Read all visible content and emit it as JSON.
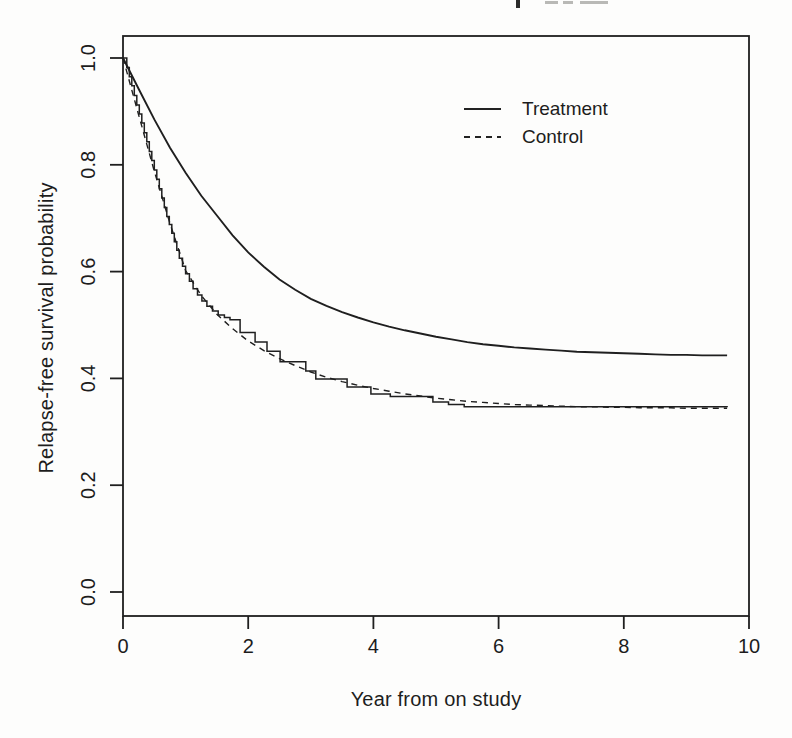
{
  "figure": {
    "background": "#fdfdfc",
    "ink": "#1f1f1f",
    "cropped_title": {
      "visible": true,
      "legible": false
    }
  },
  "chart_data": {
    "type": "line",
    "title": "",
    "xlabel": "Year from on study",
    "ylabel": "Relapse-free survival probability",
    "xlim": [
      0,
      10
    ],
    "ylim": [
      0.0,
      1.0
    ],
    "grid": false,
    "x_ticks": {
      "values": [
        0,
        2,
        4,
        6,
        8,
        10
      ],
      "labels": [
        "0",
        "2",
        "4",
        "6",
        "8",
        "10"
      ]
    },
    "y_ticks": {
      "values": [
        0.0,
        0.2,
        0.4,
        0.6,
        0.8,
        1.0
      ],
      "labels": [
        "0.0",
        "0.2",
        "0.4",
        "0.6",
        "0.8",
        "1.0"
      ]
    },
    "legend": {
      "position": "top-right-inside",
      "entries": [
        {
          "label": "Treatment",
          "line_style": "solid"
        },
        {
          "label": "Control",
          "line_style": "dashed"
        }
      ]
    },
    "series": [
      {
        "name": "Treatment",
        "line_style": "solid",
        "curve_type": "smooth",
        "asymptote": 0.44,
        "points": [
          [
            0,
            1.0
          ],
          [
            0.25,
            0.942
          ],
          [
            0.5,
            0.885
          ],
          [
            0.75,
            0.832
          ],
          [
            1,
            0.785
          ],
          [
            1.25,
            0.742
          ],
          [
            1.5,
            0.705
          ],
          [
            1.75,
            0.668
          ],
          [
            2,
            0.636
          ],
          [
            2.25,
            0.609
          ],
          [
            2.5,
            0.585
          ],
          [
            2.75,
            0.566
          ],
          [
            3,
            0.549
          ],
          [
            3.25,
            0.536
          ],
          [
            3.5,
            0.524
          ],
          [
            3.75,
            0.514
          ],
          [
            4,
            0.505
          ],
          [
            4.25,
            0.497
          ],
          [
            4.5,
            0.49
          ],
          [
            4.75,
            0.484
          ],
          [
            5,
            0.478
          ],
          [
            5.25,
            0.473
          ],
          [
            5.5,
            0.468
          ],
          [
            5.75,
            0.464
          ],
          [
            6,
            0.461
          ],
          [
            6.25,
            0.458
          ],
          [
            6.5,
            0.456
          ],
          [
            6.75,
            0.454
          ],
          [
            7,
            0.452
          ],
          [
            7.25,
            0.45
          ],
          [
            7.5,
            0.449
          ],
          [
            7.75,
            0.448
          ],
          [
            8,
            0.447
          ],
          [
            8.25,
            0.446
          ],
          [
            8.5,
            0.445
          ],
          [
            8.75,
            0.444
          ],
          [
            9,
            0.444
          ],
          [
            9.25,
            0.443
          ],
          [
            9.5,
            0.443
          ],
          [
            9.65,
            0.443
          ]
        ]
      },
      {
        "name": "Control",
        "line_style": "dashed",
        "curve_type": "smooth",
        "asymptote": 0.34,
        "points": [
          [
            0,
            1.0
          ],
          [
            0.25,
            0.893
          ],
          [
            0.5,
            0.788
          ],
          [
            0.75,
            0.69
          ],
          [
            1,
            0.602
          ],
          [
            1.25,
            0.555
          ],
          [
            1.5,
            0.52
          ],
          [
            1.75,
            0.493
          ],
          [
            2,
            0.47
          ],
          [
            2.25,
            0.452
          ],
          [
            2.5,
            0.437
          ],
          [
            2.75,
            0.424
          ],
          [
            3,
            0.412
          ],
          [
            3.25,
            0.402
          ],
          [
            3.5,
            0.394
          ],
          [
            3.75,
            0.387
          ],
          [
            4,
            0.381
          ],
          [
            4.25,
            0.376
          ],
          [
            4.5,
            0.371
          ],
          [
            4.75,
            0.367
          ],
          [
            5,
            0.363
          ],
          [
            5.25,
            0.36
          ],
          [
            5.5,
            0.357
          ],
          [
            5.75,
            0.355
          ],
          [
            6,
            0.353
          ],
          [
            6.25,
            0.351
          ],
          [
            6.5,
            0.35
          ],
          [
            6.75,
            0.349
          ],
          [
            7,
            0.348
          ],
          [
            7.25,
            0.347
          ],
          [
            7.5,
            0.347
          ],
          [
            7.75,
            0.346
          ],
          [
            8,
            0.346
          ],
          [
            8.25,
            0.345
          ],
          [
            8.5,
            0.345
          ],
          [
            8.75,
            0.345
          ],
          [
            9,
            0.344
          ],
          [
            9.25,
            0.344
          ],
          [
            9.5,
            0.344
          ],
          [
            9.65,
            0.344
          ]
        ]
      },
      {
        "name": "Observed step estimate",
        "line_style": "solid",
        "curve_type": "step",
        "points": [
          [
            0,
            1.0
          ],
          [
            0.06,
            0.982
          ],
          [
            0.1,
            0.965
          ],
          [
            0.14,
            0.948
          ],
          [
            0.18,
            0.93
          ],
          [
            0.22,
            0.912
          ],
          [
            0.26,
            0.895
          ],
          [
            0.3,
            0.878
          ],
          [
            0.34,
            0.86
          ],
          [
            0.38,
            0.843
          ],
          [
            0.42,
            0.825
          ],
          [
            0.46,
            0.808
          ],
          [
            0.5,
            0.79
          ],
          [
            0.54,
            0.773
          ],
          [
            0.58,
            0.755
          ],
          [
            0.62,
            0.738
          ],
          [
            0.66,
            0.72
          ],
          [
            0.7,
            0.703
          ],
          [
            0.74,
            0.688
          ],
          [
            0.78,
            0.672
          ],
          [
            0.82,
            0.656
          ],
          [
            0.86,
            0.64
          ],
          [
            0.9,
            0.625
          ],
          [
            0.95,
            0.61
          ],
          [
            1.0,
            0.596
          ],
          [
            1.06,
            0.582
          ],
          [
            1.12,
            0.568
          ],
          [
            1.19,
            0.556
          ],
          [
            1.26,
            0.545
          ],
          [
            1.34,
            0.535
          ],
          [
            1.43,
            0.526
          ],
          [
            1.52,
            0.519
          ],
          [
            1.62,
            0.514
          ],
          [
            1.71,
            0.51
          ],
          [
            1.87,
            0.486
          ],
          [
            2.11,
            0.468
          ],
          [
            2.3,
            0.451
          ],
          [
            2.51,
            0.431
          ],
          [
            2.92,
            0.414
          ],
          [
            3.08,
            0.399
          ],
          [
            3.58,
            0.384
          ],
          [
            3.96,
            0.371
          ],
          [
            4.27,
            0.366
          ],
          [
            4.95,
            0.356
          ],
          [
            5.2,
            0.351
          ],
          [
            5.45,
            0.347
          ],
          [
            9.65,
            0.346
          ]
        ]
      }
    ]
  }
}
